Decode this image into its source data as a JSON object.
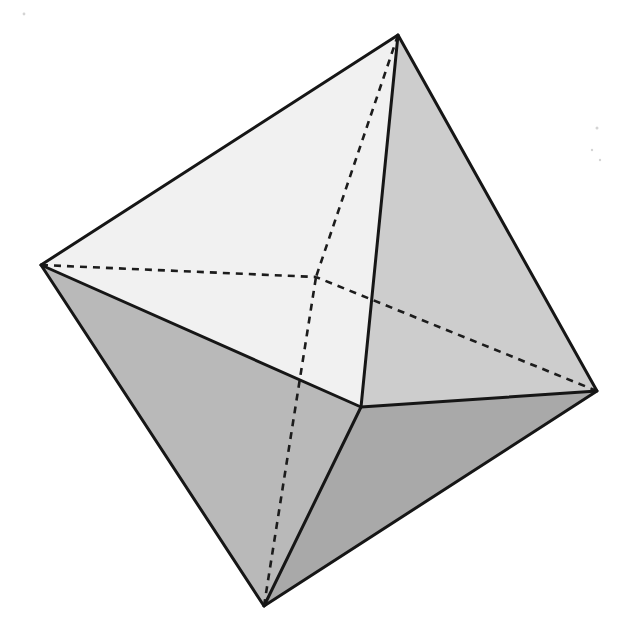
{
  "figure": {
    "view": "perspective, one vertex hidden behind the solid",
    "vertices": {
      "left": {
        "x": 41,
        "y": 265
      },
      "top": {
        "x": 398,
        "y": 35
      },
      "right": {
        "x": 597,
        "y": 391
      },
      "bottom": {
        "x": 264,
        "y": 606
      },
      "front": {
        "x": 361,
        "y": 407
      },
      "back": {
        "x": 316,
        "y": 277
      }
    },
    "faces": [
      {
        "id": "upper-left",
        "vertices": [
          "left",
          "top",
          "front"
        ],
        "color": "#f1f1f1"
      },
      {
        "id": "upper-right",
        "vertices": [
          "top",
          "right",
          "front"
        ],
        "color": "#cdcdcd"
      },
      {
        "id": "lower-left",
        "vertices": [
          "left",
          "front",
          "bottom"
        ],
        "color": "#b9b9b9"
      },
      {
        "id": "lower-right",
        "vertices": [
          "front",
          "right",
          "bottom"
        ],
        "color": "#a9a9a9"
      }
    ],
    "visible_edges": [
      [
        "left",
        "top"
      ],
      [
        "top",
        "right"
      ],
      [
        "right",
        "bottom"
      ],
      [
        "bottom",
        "left"
      ],
      [
        "left",
        "front"
      ],
      [
        "top",
        "front"
      ],
      [
        "right",
        "front"
      ],
      [
        "bottom",
        "front"
      ]
    ],
    "hidden_edges": [
      [
        "left",
        "back"
      ],
      [
        "top",
        "back"
      ],
      [
        "right",
        "back"
      ],
      [
        "bottom",
        "back"
      ]
    ],
    "colors": {
      "background": "#ffffff",
      "edge": "#161616"
    }
  }
}
